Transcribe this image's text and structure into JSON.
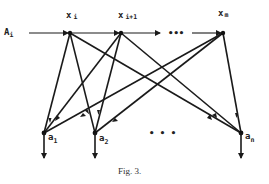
{
  "diagram": {
    "caption": "Fig. 3.",
    "input_label": {
      "main": "A",
      "sub": "i"
    },
    "top_nodes": [
      {
        "id": "x_i",
        "main": "x",
        "sub": "i"
      },
      {
        "id": "x_i+1",
        "main": "x",
        "sub": "i+1"
      },
      {
        "id": "x_m",
        "main": "x",
        "sub": "m"
      }
    ],
    "top_ellipsis": "•••",
    "bottom_nodes": [
      {
        "id": "a_1",
        "main": "a",
        "sub": "1"
      },
      {
        "id": "a_2",
        "main": "a",
        "sub": "2"
      },
      {
        "id": "a_n",
        "main": "a",
        "sub": "n"
      }
    ],
    "bottom_ellipsis": "•  •  •",
    "edges": [
      [
        "A_i",
        "x_i"
      ],
      [
        "x_i",
        "x_i+1"
      ],
      [
        "x_i+1",
        "..."
      ],
      [
        "...",
        "x_m"
      ],
      [
        "x_i",
        "a_1"
      ],
      [
        "x_i",
        "a_2"
      ],
      [
        "x_i",
        "a_n"
      ],
      [
        "x_i+1",
        "a_1"
      ],
      [
        "x_i+1",
        "a_2"
      ],
      [
        "x_i+1",
        "a_n"
      ],
      [
        "x_m",
        "a_1"
      ],
      [
        "x_m",
        "a_2"
      ],
      [
        "x_m",
        "a_n"
      ],
      [
        "a_1",
        "out"
      ],
      [
        "a_2",
        "out"
      ],
      [
        "a_n",
        "out"
      ]
    ]
  }
}
